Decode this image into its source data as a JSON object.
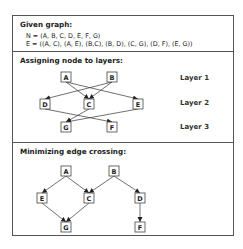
{
  "sections": {
    "given": {
      "title": "Given graph:",
      "nodes_line": "N = (A, B, C, D, E, F, G)",
      "edges_line": "E = ((A, C), (A, E), (B,C), (B, D), (C, G), (D, F), (E, G))"
    },
    "layers": {
      "title": "Assigning node to layers:",
      "layer_labels": [
        "Layer 1",
        "Layer 2",
        "Layer 3"
      ],
      "nodes": [
        {
          "id": "A",
          "x": 61,
          "y": 72
        },
        {
          "id": "B",
          "x": 107,
          "y": 72
        },
        {
          "id": "D",
          "x": 40,
          "y": 99
        },
        {
          "id": "C",
          "x": 84,
          "y": 99
        },
        {
          "id": "E",
          "x": 133,
          "y": 99
        },
        {
          "id": "G",
          "x": 61,
          "y": 122
        },
        {
          "id": "F",
          "x": 107,
          "y": 122
        }
      ],
      "edges": [
        [
          "A",
          "C"
        ],
        [
          "A",
          "E"
        ],
        [
          "B",
          "C"
        ],
        [
          "B",
          "D"
        ],
        [
          "C",
          "G"
        ],
        [
          "D",
          "F"
        ],
        [
          "E",
          "G"
        ]
      ]
    },
    "minimize": {
      "title": "Minimizing edge crossing:",
      "nodes": [
        {
          "id": "A",
          "x": 61,
          "y": 166
        },
        {
          "id": "B",
          "x": 109,
          "y": 166
        },
        {
          "id": "E",
          "x": 37,
          "y": 193
        },
        {
          "id": "C",
          "x": 84,
          "y": 193
        },
        {
          "id": "D",
          "x": 135,
          "y": 193
        },
        {
          "id": "G",
          "x": 61,
          "y": 222
        },
        {
          "id": "F",
          "x": 135,
          "y": 222
        }
      ],
      "edges": [
        [
          "A",
          "E"
        ],
        [
          "A",
          "C"
        ],
        [
          "B",
          "C"
        ],
        [
          "B",
          "D"
        ],
        [
          "E",
          "G"
        ],
        [
          "C",
          "G"
        ],
        [
          "D",
          "F"
        ]
      ]
    }
  }
}
